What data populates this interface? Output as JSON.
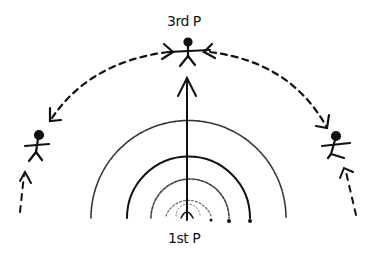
{
  "diagram": {
    "type": "hand-drawn sketch",
    "labels": {
      "top": "3rd P",
      "bottom": "1st P"
    },
    "figures": [
      {
        "id": "third-person",
        "position": "top-center"
      },
      {
        "id": "left-person",
        "position": "left"
      },
      {
        "id": "right-person",
        "position": "right"
      }
    ],
    "colors": {
      "ink": "#111111",
      "faint_ink": "#555555",
      "background": "#ffffff"
    }
  }
}
